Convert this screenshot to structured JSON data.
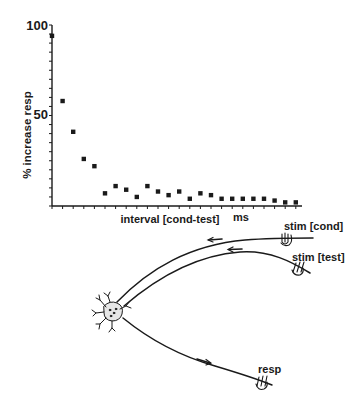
{
  "chart_data": {
    "type": "scatter",
    "title": "",
    "xlabel": "interval [cond-test]",
    "xunit": "ms",
    "ylabel": "% increase resp",
    "ylim": [
      0,
      100
    ],
    "yticks": [
      50,
      100
    ],
    "ytick_labels": [
      "50",
      "100"
    ],
    "grid": false,
    "legend": null,
    "x": [
      1,
      2,
      3,
      4,
      5,
      6,
      7,
      8,
      9,
      10,
      11,
      12,
      13,
      14,
      15,
      16,
      17,
      18,
      19,
      20,
      21,
      22,
      23,
      24
    ],
    "values": [
      94,
      58,
      41,
      26,
      22,
      7,
      11,
      9,
      5,
      11,
      8,
      6,
      8,
      4,
      7,
      6,
      4,
      4,
      4,
      4,
      4,
      3,
      2,
      2
    ],
    "series": [
      {
        "name": "% increase resp",
        "values": [
          94,
          58,
          41,
          26,
          22,
          7,
          11,
          9,
          5,
          11,
          8,
          6,
          8,
          4,
          7,
          6,
          4,
          4,
          4,
          4,
          4,
          3,
          2,
          2
        ]
      }
    ]
  },
  "diagram": {
    "stim_cond_label": "stim [cond]",
    "stim_test_label": "stim [test]",
    "resp_label": "resp"
  },
  "colors": {
    "ink": "#1a1a1a",
    "background": "#ffffff"
  }
}
